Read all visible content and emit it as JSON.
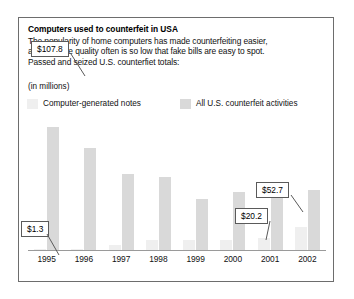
{
  "figure": {
    "title": "Computers used to counterfeit in USA",
    "body_lines": [
      "The popularity of home computers has made counterfeiting easier,",
      "although the quality often is so low that fake bills are easy to spot.",
      "Passed and seized U.S. counterfiet totals:"
    ],
    "units_note": "(in millions)",
    "border_color": "#6d6d6d"
  },
  "legend": {
    "items": [
      {
        "label": "Computer-generated notes",
        "color": "#efefef",
        "swatch_name": "legend-swatch-computer-generated"
      },
      {
        "label": "All U.S. counterfeit activities",
        "color": "#d9d9d9",
        "swatch_name": "legend-swatch-all-counterfeit"
      }
    ]
  },
  "callouts": [
    {
      "name": "callout-107-8",
      "value": "$107.8",
      "target": "1995 all-counterfeit bar"
    },
    {
      "name": "callout-1-3",
      "value": "$1.3",
      "target": "1995 computer-generated bar"
    },
    {
      "name": "callout-52-7",
      "value": "$52.7",
      "target": "2002 all-counterfeit bar"
    },
    {
      "name": "callout-20-2",
      "value": "$20.2",
      "target": "2002 computer-generated bar"
    }
  ],
  "chart_data": {
    "type": "bar",
    "title": "Computers used to counterfeit in USA",
    "subtitle": "Passed and seized U.S. counterfiet totals:",
    "xlabel": "",
    "ylabel": "(in millions)",
    "unit": "millions of U.S. dollars",
    "grid": false,
    "legend_position": "top",
    "ylim": [
      0,
      112
    ],
    "categories": [
      "1995",
      "1996",
      "1997",
      "1998",
      "1999",
      "2000",
      "2001",
      "2002"
    ],
    "series": [
      {
        "name": "Computer-generated notes",
        "color": "#efefef",
        "values": [
          1.3,
          0.4,
          4.5,
          8.7,
          8.8,
          9.0,
          10.1,
          20.2
        ]
      },
      {
        "name": "All U.S. counterfeit activities",
        "color": "#d9d9d9",
        "values": [
          107.8,
          89.5,
          66.3,
          63.5,
          44.5,
          50.6,
          54.0,
          52.7
        ]
      }
    ],
    "annotations": [
      {
        "label": "$107.8",
        "series": "All U.S. counterfeit activities",
        "category": "1995",
        "value": 107.8
      },
      {
        "label": "$1.3",
        "series": "Computer-generated notes",
        "category": "1995",
        "value": 1.3
      },
      {
        "label": "$52.7",
        "series": "All U.S. counterfeit activities",
        "category": "2002",
        "value": 52.7
      },
      {
        "label": "$20.2",
        "series": "Computer-generated notes",
        "category": "2002",
        "value": 20.2
      }
    ]
  }
}
